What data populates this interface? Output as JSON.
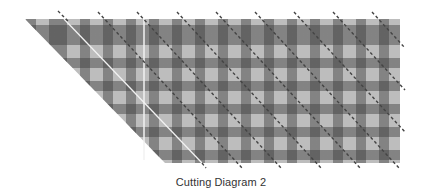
{
  "diagram": {
    "caption": "Cutting Diagram 2",
    "shape": "parallelogram",
    "pattern": "gingham",
    "colors": {
      "fabric_light": "#bdbdbd",
      "fabric_dark_band": "#3c3c3c",
      "cut_line": "#444444",
      "fold_line": "#ffffff",
      "caption_text": "#333333"
    },
    "outline": [
      [
        25,
        19
      ],
      [
        400,
        19
      ],
      [
        400,
        163
      ],
      [
        165,
        163
      ]
    ],
    "dashed_cut_lines_count": 9,
    "solid_white_lines": [
      "vertical guide",
      "diagonal guide"
    ]
  }
}
